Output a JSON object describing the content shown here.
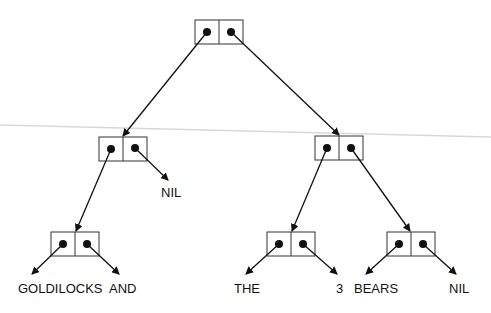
{
  "diagram": {
    "title": "",
    "nodes": [
      {
        "id": "root",
        "type": "cons-cell"
      },
      {
        "id": "left",
        "type": "cons-cell"
      },
      {
        "id": "right",
        "type": "cons-cell"
      },
      {
        "id": "ll",
        "type": "cons-cell"
      },
      {
        "id": "rl",
        "type": "cons-cell"
      },
      {
        "id": "rr",
        "type": "cons-cell"
      }
    ],
    "labels": {
      "nil_1": "NIL",
      "goldilocks": "GOLDILOCKS",
      "and": "AND",
      "the": "THE",
      "three": "3",
      "bears": "BEARS",
      "nil_2": "NIL"
    },
    "edges": [
      {
        "from": "root.car",
        "to": "left"
      },
      {
        "from": "root.cdr",
        "to": "right"
      },
      {
        "from": "left.car",
        "to": "ll"
      },
      {
        "from": "left.cdr",
        "to": "NIL"
      },
      {
        "from": "right.car",
        "to": "rl"
      },
      {
        "from": "right.cdr",
        "to": "rr"
      },
      {
        "from": "ll.car",
        "to": "GOLDILOCKS"
      },
      {
        "from": "ll.cdr",
        "to": "AND"
      },
      {
        "from": "rl.car",
        "to": "THE"
      },
      {
        "from": "rl.cdr",
        "to": "3"
      },
      {
        "from": "rr.car",
        "to": "BEARS"
      },
      {
        "from": "rr.cdr",
        "to": "NIL"
      }
    ]
  }
}
